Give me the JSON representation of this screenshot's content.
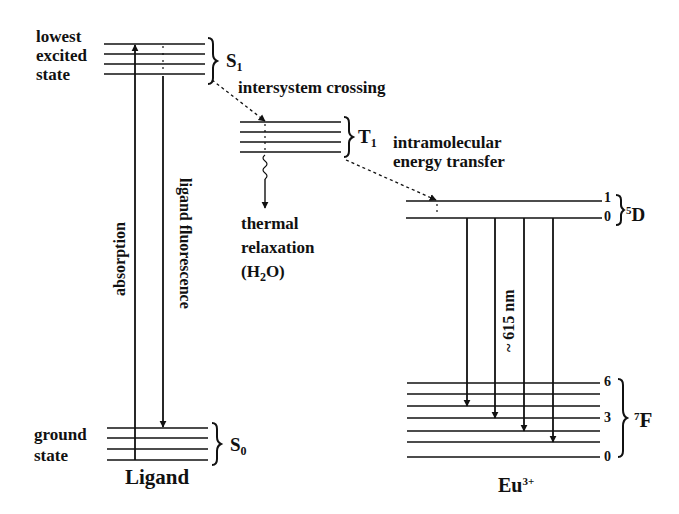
{
  "ligand": {
    "title": "Ligand",
    "s1": {
      "label_main": "S",
      "label_sub": "1",
      "desc": [
        "lowest",
        "excited",
        "state"
      ]
    },
    "t1": {
      "label_main": "T",
      "label_sub": "1"
    },
    "s0": {
      "label_main": "S",
      "label_sub": "0",
      "desc": [
        "ground",
        "state"
      ]
    },
    "absorption": "absorption",
    "fluorescence": "ligand fluorescence",
    "isc": "intersystem crossing",
    "thermal": {
      "line1": "thermal",
      "line2": "relaxation",
      "line3_pre": "(H",
      "line3_sub": "2",
      "line3_post": "O)"
    }
  },
  "transfer": {
    "line1": "intramolecular",
    "line2": "energy transfer"
  },
  "europium": {
    "title_main": "Eu",
    "title_sup": "3+",
    "d5": {
      "label_sup": "5",
      "label_main": "D",
      "levels": [
        "1",
        "0"
      ]
    },
    "f7": {
      "label_sup": "7",
      "label_main": "F",
      "levels": [
        "6",
        "3",
        "0"
      ]
    },
    "emission": "~ 615 nm"
  },
  "colors": {
    "line": "#111111",
    "background": "#ffffff"
  }
}
